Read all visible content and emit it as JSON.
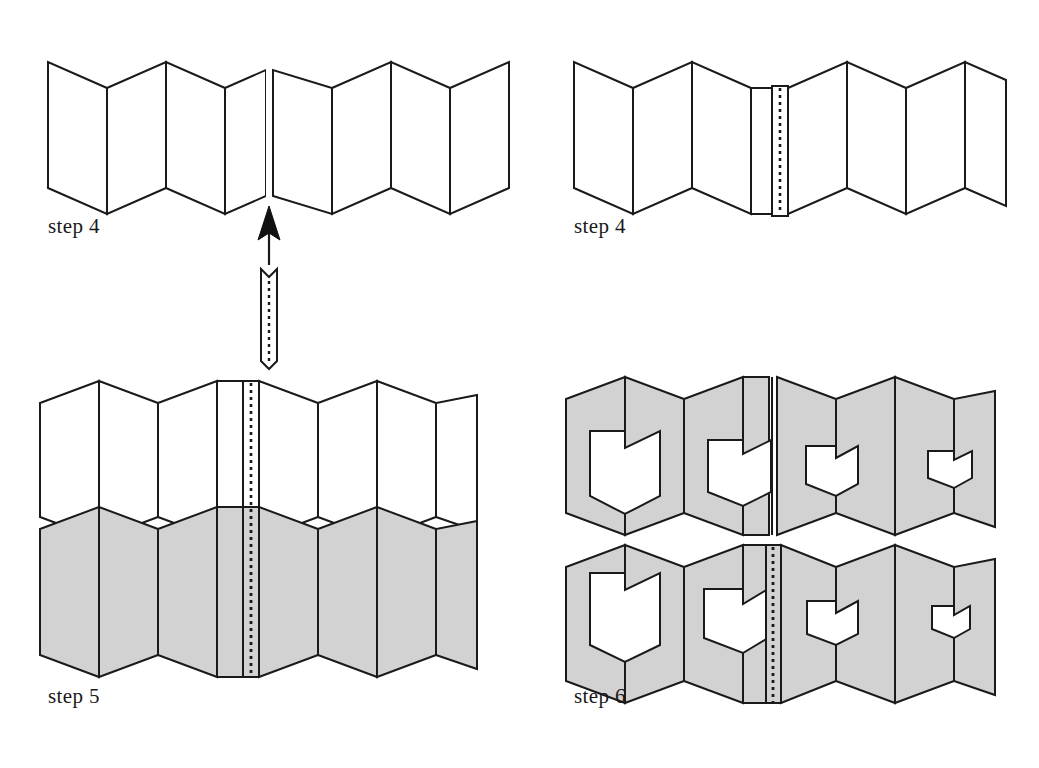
{
  "figure": {
    "kind": "origami-folding-instruction-diagram",
    "background_color": "#ffffff",
    "line_color": "#1a1a1a",
    "shade_color": "#d2d2d2",
    "panel_fill_white": "#ffffff",
    "panels": [
      {
        "id": "panel-top-left",
        "caption": "step 4",
        "description": "Accordion-folded strip, unshaded, split into two halves with a gap at the center; an arrow below points up at the gap; a narrow notched insert strip with a dotted fold line sits below the arrow."
      },
      {
        "id": "panel-top-right",
        "caption": "step 4",
        "description": "Same accordion with the narrow insert strip seated in the central valley fold, its dotted fold line visible."
      },
      {
        "id": "panel-bottom-left",
        "caption": "step 5",
        "description": "Two stacked accordions: an unshaded one above and a shaded gray one below, both carrying the central dotted insert strip."
      },
      {
        "id": "panel-bottom-right",
        "caption": "step 6",
        "description": "Two stacked shaded accordions with shield-shaped windows cut through the folds, decreasing in size from left to right; the lower accordion shows the dotted insert strip at center."
      }
    ],
    "captions": {
      "step4_left": "step 4",
      "step4_right": "step 4",
      "step5": "step 5",
      "step6": "step 6"
    },
    "geometry": {
      "accordion_panel_count": 8,
      "peak_y_offset": 0,
      "valley_y_offset": 28,
      "edge_y_offset": 14,
      "panel_half_width": 30,
      "body_height": 126,
      "insert_strip": {
        "notch_depth": 10,
        "width": 12,
        "dash_pattern": "3 4"
      },
      "window_sizes_top_row": [
        0.82,
        0.62,
        0.4,
        0.26
      ],
      "window_sizes_bottom_row": [
        0.88,
        0.66,
        0.44,
        0.28
      ]
    }
  }
}
